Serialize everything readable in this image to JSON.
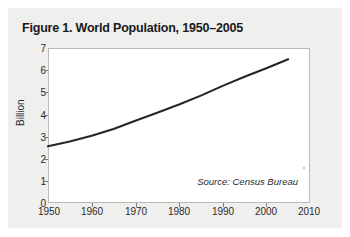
{
  "figure": {
    "title": "Figure 1. World Population, 1950–2005",
    "source_note": "Source: Census Bureau"
  },
  "chart_data": {
    "type": "line",
    "title": "Figure 1. World Population, 1950–2005",
    "xlabel": "",
    "ylabel": "Billion",
    "xlim": [
      1950,
      2010
    ],
    "ylim": [
      0,
      7
    ],
    "grid": false,
    "legend": null,
    "x_ticks": [
      1950,
      1960,
      1970,
      1980,
      1990,
      2000,
      2010
    ],
    "y_ticks": [
      0,
      1,
      2,
      3,
      4,
      5,
      6,
      7
    ],
    "annotations": [
      "Source: Census Bureau"
    ],
    "series": [
      {
        "name": "World Population",
        "color": "#262626",
        "x": [
          1950,
          1955,
          1960,
          1965,
          1970,
          1975,
          1980,
          1985,
          1990,
          1995,
          2000,
          2005
        ],
        "values": [
          2.56,
          2.78,
          3.04,
          3.34,
          3.71,
          4.08,
          4.45,
          4.85,
          5.29,
          5.7,
          6.09,
          6.49
        ]
      }
    ]
  }
}
